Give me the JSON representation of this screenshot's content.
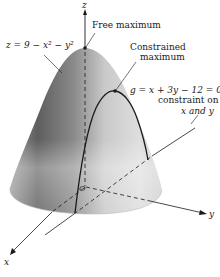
{
  "figure": {
    "surface_equation": "z = 9 − x² − y²",
    "labels": {
      "z_axis": "z",
      "x_axis": "x",
      "y_axis": "y",
      "origin": "O",
      "free_max": "Free maximum",
      "constrained_max_line1": "Constrained",
      "constrained_max_line2": "maximum",
      "surface_eq": "z = 9 − x² − y²",
      "constraint_eq": "g = x + 3y − 12 = 0",
      "constraint_line1": "constraint on",
      "constraint_line2": "x and y"
    },
    "colors": {
      "surface_dark": "#6e6e6e",
      "surface_mid": "#a8a8a8",
      "surface_light": "#e6e6e6",
      "ink": "#1a1a1a"
    }
  }
}
